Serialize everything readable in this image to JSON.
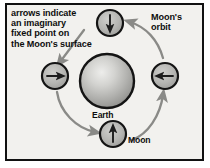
{
  "figure": {
    "background_color": "#f2f1ee",
    "border_color": "#111111",
    "page_color": "#ffffff"
  },
  "annotations": {
    "note": "arrows indicate\nan imaginary\nfixed point on\nthe Moon's surface",
    "note_lines": [
      "arrows indicate",
      "an imaginary",
      "fixed point on",
      "the Moon's surface"
    ],
    "orbit_label": "Moon's\norbit",
    "orbit_label_lines": [
      "Moon's",
      "orbit"
    ]
  },
  "bodies": {
    "earth": {
      "label": "Earth",
      "cx": 107,
      "cy": 81,
      "r": 27,
      "fill_light": "#e8e8e6",
      "fill_mid": "#b9b9b6",
      "fill_dark": "#8e8e8b",
      "stroke": "#141414"
    },
    "moons": [
      {
        "name": "moon-top",
        "cx": 110,
        "cy": 23,
        "r": 13,
        "arrow_direction": "down",
        "fill": "#b5b5b2",
        "stroke": "#141414"
      },
      {
        "name": "moon-left",
        "cx": 55,
        "cy": 76,
        "r": 13,
        "arrow_direction": "right",
        "fill": "#b5b5b2",
        "stroke": "#141414"
      },
      {
        "name": "moon-bottom",
        "cx": 113,
        "cy": 134,
        "r": 13,
        "arrow_direction": "up",
        "fill": "#b5b5b2",
        "stroke": "#141414"
      },
      {
        "name": "moon-right",
        "cx": 165,
        "cy": 76,
        "r": 13,
        "arrow_direction": "left",
        "fill": "#b5b5b2",
        "stroke": "#141414"
      }
    ],
    "moon_label": "Moon"
  },
  "orbit_arrows": {
    "color": "#8a8a87",
    "direction": "counterclockwise",
    "segments": [
      {
        "name": "arrow-left-to-bottom",
        "from": "moon-left",
        "to": "moon-bottom"
      },
      {
        "name": "arrow-bottom-to-right",
        "from": "moon-bottom",
        "to": "moon-right"
      },
      {
        "name": "arrow-right-to-top",
        "from": "moon-right",
        "to": "moon-top"
      }
    ]
  },
  "pointer": {
    "name": "note-pointer",
    "color": "#8a8a87",
    "from_text": "the Moon's surface",
    "to_body": "moon-left"
  }
}
